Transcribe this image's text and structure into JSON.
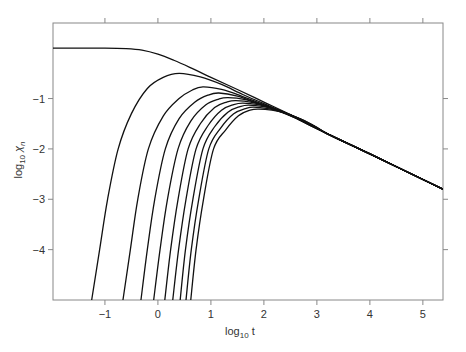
{
  "chart_data": {
    "type": "line",
    "title": "",
    "xlabel": "log10 t",
    "ylabel": "log10 χn",
    "xlabel_parts": {
      "base": "log",
      "sub": "10",
      "var": " t"
    },
    "ylabel_parts": {
      "base": "log",
      "sub": "10",
      "var": " χ",
      "varsub": "n"
    },
    "xlim": [
      -1.98,
      5.38
    ],
    "ylim": [
      -5.0,
      0.5
    ],
    "xticks": [
      -1,
      0,
      1,
      2,
      3,
      4,
      5
    ],
    "xtick_labels": [
      "−1",
      "0",
      "1",
      "2",
      "3",
      "4",
      "5"
    ],
    "yticks": [
      -1,
      -2,
      -3,
      -4
    ],
    "ytick_labels": [
      "−1",
      "−2",
      "−3",
      "−4"
    ],
    "grid": false,
    "legend": null,
    "line_color": "#111111",
    "axis_color": "#888888",
    "series": [
      {
        "name": "n=0",
        "points": [
          [
            -1.98,
            0.0
          ],
          [
            -1.0,
            0.0
          ],
          [
            -0.6,
            -0.01
          ],
          [
            -0.3,
            -0.04
          ],
          [
            0.0,
            -0.12
          ],
          [
            0.3,
            -0.24
          ],
          [
            0.6,
            -0.38
          ],
          [
            1.0,
            -0.58
          ],
          [
            1.5,
            -0.82
          ],
          [
            2.0,
            -1.07
          ],
          [
            2.5,
            -1.32
          ],
          [
            3.0,
            -1.6
          ],
          [
            4.0,
            -2.1
          ],
          [
            5.38,
            -2.8
          ]
        ]
      },
      {
        "name": "n=1",
        "points": [
          [
            -1.25,
            -5.0
          ],
          [
            -1.1,
            -4.0
          ],
          [
            -0.95,
            -3.0
          ],
          [
            -0.75,
            -2.0
          ],
          [
            -0.5,
            -1.3
          ],
          [
            -0.2,
            -0.8
          ],
          [
            0.1,
            -0.58
          ],
          [
            0.4,
            -0.5
          ],
          [
            0.8,
            -0.57
          ],
          [
            1.2,
            -0.72
          ],
          [
            1.6,
            -0.92
          ],
          [
            2.0,
            -1.1
          ],
          [
            2.5,
            -1.33
          ],
          [
            3.0,
            -1.6
          ],
          [
            4.0,
            -2.1
          ],
          [
            5.38,
            -2.8
          ]
        ]
      },
      {
        "name": "n=2",
        "points": [
          [
            -0.66,
            -5.0
          ],
          [
            -0.52,
            -4.0
          ],
          [
            -0.38,
            -3.0
          ],
          [
            -0.18,
            -2.0
          ],
          [
            0.1,
            -1.35
          ],
          [
            0.4,
            -1.0
          ],
          [
            0.65,
            -0.83
          ],
          [
            0.85,
            -0.77
          ],
          [
            1.2,
            -0.82
          ],
          [
            1.6,
            -0.96
          ],
          [
            2.0,
            -1.12
          ],
          [
            2.5,
            -1.34
          ],
          [
            3.0,
            -1.6
          ],
          [
            4.0,
            -2.1
          ],
          [
            5.38,
            -2.8
          ]
        ]
      },
      {
        "name": "n=3",
        "points": [
          [
            -0.32,
            -5.0
          ],
          [
            -0.2,
            -4.0
          ],
          [
            -0.06,
            -3.0
          ],
          [
            0.14,
            -2.0
          ],
          [
            0.4,
            -1.4
          ],
          [
            0.7,
            -1.07
          ],
          [
            0.95,
            -0.93
          ],
          [
            1.15,
            -0.89
          ],
          [
            1.5,
            -0.95
          ],
          [
            1.9,
            -1.1
          ],
          [
            2.3,
            -1.26
          ],
          [
            2.8,
            -1.48
          ],
          [
            3.2,
            -1.7
          ],
          [
            4.0,
            -2.1
          ],
          [
            5.38,
            -2.8
          ]
        ]
      },
      {
        "name": "n=4",
        "points": [
          [
            -0.08,
            -5.0
          ],
          [
            0.04,
            -4.0
          ],
          [
            0.18,
            -3.0
          ],
          [
            0.38,
            -2.0
          ],
          [
            0.62,
            -1.45
          ],
          [
            0.9,
            -1.13
          ],
          [
            1.15,
            -1.01
          ],
          [
            1.32,
            -0.98
          ],
          [
            1.65,
            -1.02
          ],
          [
            2.0,
            -1.14
          ],
          [
            2.4,
            -1.29
          ],
          [
            2.8,
            -1.48
          ],
          [
            3.2,
            -1.7
          ],
          [
            4.0,
            -2.1
          ],
          [
            5.38,
            -2.8
          ]
        ]
      },
      {
        "name": "n=5",
        "points": [
          [
            0.13,
            -5.0
          ],
          [
            0.24,
            -4.0
          ],
          [
            0.38,
            -3.0
          ],
          [
            0.57,
            -2.0
          ],
          [
            0.8,
            -1.5
          ],
          [
            1.07,
            -1.18
          ],
          [
            1.3,
            -1.07
          ],
          [
            1.47,
            -1.04
          ],
          [
            1.8,
            -1.08
          ],
          [
            2.1,
            -1.17
          ],
          [
            2.5,
            -1.33
          ],
          [
            2.9,
            -1.52
          ],
          [
            3.2,
            -1.7
          ],
          [
            4.0,
            -2.1
          ],
          [
            5.38,
            -2.8
          ]
        ]
      },
      {
        "name": "n=6",
        "points": [
          [
            0.28,
            -5.0
          ],
          [
            0.39,
            -4.0
          ],
          [
            0.53,
            -3.0
          ],
          [
            0.72,
            -2.0
          ],
          [
            0.95,
            -1.53
          ],
          [
            1.2,
            -1.23
          ],
          [
            1.43,
            -1.12
          ],
          [
            1.6,
            -1.09
          ],
          [
            1.9,
            -1.12
          ],
          [
            2.2,
            -1.2
          ],
          [
            2.55,
            -1.35
          ],
          [
            2.9,
            -1.52
          ],
          [
            3.2,
            -1.7
          ],
          [
            4.0,
            -2.1
          ],
          [
            5.38,
            -2.8
          ]
        ]
      },
      {
        "name": "n=7",
        "points": [
          [
            0.42,
            -5.0
          ],
          [
            0.52,
            -4.0
          ],
          [
            0.66,
            -3.0
          ],
          [
            0.85,
            -2.0
          ],
          [
            1.07,
            -1.56
          ],
          [
            1.32,
            -1.27
          ],
          [
            1.55,
            -1.16
          ],
          [
            1.71,
            -1.13
          ],
          [
            2.0,
            -1.16
          ],
          [
            2.3,
            -1.24
          ],
          [
            2.6,
            -1.37
          ],
          [
            2.95,
            -1.55
          ],
          [
            3.2,
            -1.7
          ],
          [
            4.0,
            -2.1
          ],
          [
            5.38,
            -2.8
          ]
        ]
      },
      {
        "name": "n=8",
        "points": [
          [
            0.53,
            -5.0
          ],
          [
            0.63,
            -4.0
          ],
          [
            0.77,
            -3.0
          ],
          [
            0.96,
            -2.0
          ],
          [
            1.18,
            -1.59
          ],
          [
            1.43,
            -1.3
          ],
          [
            1.65,
            -1.2
          ],
          [
            1.8,
            -1.17
          ],
          [
            2.08,
            -1.2
          ],
          [
            2.35,
            -1.27
          ],
          [
            2.65,
            -1.39
          ],
          [
            2.95,
            -1.55
          ],
          [
            3.2,
            -1.7
          ],
          [
            4.0,
            -2.1
          ],
          [
            5.38,
            -2.8
          ]
        ]
      },
      {
        "name": "n=9",
        "points": [
          [
            0.62,
            -5.0
          ],
          [
            0.72,
            -4.0
          ],
          [
            0.86,
            -3.0
          ],
          [
            1.05,
            -2.0
          ],
          [
            1.28,
            -1.62
          ],
          [
            1.52,
            -1.34
          ],
          [
            1.74,
            -1.23
          ],
          [
            1.9,
            -1.21
          ],
          [
            2.15,
            -1.23
          ],
          [
            2.4,
            -1.29
          ],
          [
            2.7,
            -1.41
          ],
          [
            3.0,
            -1.57
          ],
          [
            3.2,
            -1.7
          ],
          [
            4.0,
            -2.1
          ],
          [
            5.38,
            -2.8
          ]
        ]
      }
    ]
  }
}
